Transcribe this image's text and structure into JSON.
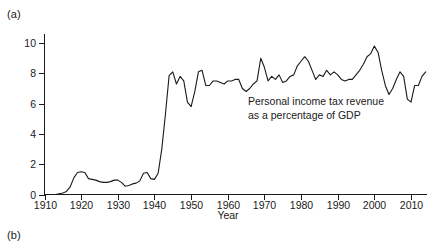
{
  "figure": {
    "panel_a_label": "(a)",
    "panel_b_label": "(b)"
  },
  "chart_data": {
    "type": "line",
    "title": "",
    "subtitle": "",
    "xlabel": "Year",
    "ylabel": "",
    "annotation": {
      "line1": "Personal income tax revenue",
      "line2": "as a percentage of GDP"
    },
    "legend": [],
    "legend_position": "none",
    "grid": false,
    "xlim": [
      1910,
      2014
    ],
    "ylim": [
      0,
      10.6
    ],
    "xticks": [
      1910,
      1920,
      1930,
      1940,
      1950,
      1960,
      1970,
      1980,
      1990,
      2000,
      2010
    ],
    "xtick_labels": [
      "1910",
      "1920",
      "1930",
      "1940",
      "1950",
      "1960",
      "1970",
      "1980",
      "1990",
      "2000",
      "2010"
    ],
    "yticks": [
      0,
      2,
      4,
      6,
      8,
      10
    ],
    "ytick_labels": [
      "0",
      "2",
      "4",
      "6",
      "8",
      "10"
    ],
    "series": [
      {
        "name": "Personal income tax revenue as a percentage of GDP",
        "x": [
          1910,
          1911,
          1912,
          1913,
          1914,
          1915,
          1916,
          1917,
          1918,
          1919,
          1920,
          1921,
          1922,
          1923,
          1924,
          1925,
          1926,
          1927,
          1928,
          1929,
          1930,
          1931,
          1932,
          1933,
          1934,
          1935,
          1936,
          1937,
          1938,
          1939,
          1940,
          1941,
          1942,
          1943,
          1944,
          1945,
          1946,
          1947,
          1948,
          1949,
          1950,
          1951,
          1952,
          1953,
          1954,
          1955,
          1956,
          1957,
          1958,
          1959,
          1960,
          1961,
          1962,
          1963,
          1964,
          1965,
          1966,
          1967,
          1968,
          1969,
          1970,
          1971,
          1972,
          1973,
          1974,
          1975,
          1976,
          1977,
          1978,
          1979,
          1980,
          1981,
          1982,
          1983,
          1984,
          1985,
          1986,
          1987,
          1988,
          1989,
          1990,
          1991,
          1992,
          1993,
          1994,
          1995,
          1996,
          1997,
          1998,
          1999,
          2000,
          2001,
          2002,
          2003,
          2004,
          2005,
          2006,
          2007,
          2008,
          2009,
          2010,
          2011,
          2012,
          2013,
          2014
        ],
        "values": [
          0.0,
          0.0,
          0.0,
          0.0,
          0.05,
          0.1,
          0.2,
          0.5,
          1.1,
          1.45,
          1.5,
          1.45,
          1.05,
          1.0,
          0.95,
          0.85,
          0.8,
          0.8,
          0.85,
          0.95,
          0.95,
          0.8,
          0.55,
          0.6,
          0.7,
          0.75,
          0.9,
          1.4,
          1.45,
          1.05,
          1.0,
          1.4,
          3.0,
          5.3,
          7.85,
          8.1,
          7.3,
          7.8,
          7.5,
          6.1,
          5.8,
          6.8,
          8.1,
          8.2,
          7.2,
          7.2,
          7.5,
          7.5,
          7.4,
          7.3,
          7.5,
          7.5,
          7.6,
          7.6,
          7.0,
          6.8,
          7.0,
          7.3,
          7.5,
          9.0,
          8.4,
          7.5,
          7.8,
          7.6,
          7.9,
          7.4,
          7.5,
          7.8,
          7.9,
          8.5,
          8.8,
          9.1,
          8.8,
          8.2,
          7.6,
          7.9,
          7.8,
          8.2,
          7.9,
          8.1,
          7.9,
          7.6,
          7.5,
          7.6,
          7.6,
          7.9,
          8.2,
          8.6,
          9.1,
          9.3,
          9.8,
          9.4,
          8.2,
          7.2,
          6.6,
          7.0,
          7.6,
          8.1,
          7.8,
          6.3,
          6.1,
          7.2,
          7.2,
          7.8,
          8.1
        ]
      }
    ]
  }
}
